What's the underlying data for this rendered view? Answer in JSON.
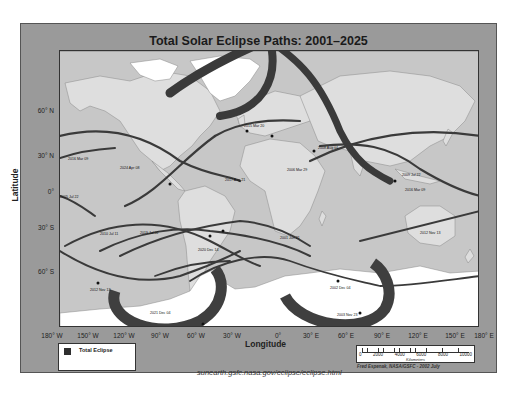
{
  "title": "Total Solar Eclipse Paths: 2001–2025",
  "axes": {
    "latitude_title": "Latitude",
    "longitude_title": "Longitude",
    "latitude_ticks": [
      {
        "label": "60° N",
        "y": 110
      },
      {
        "label": "30° N",
        "y": 155
      },
      {
        "label": "0°",
        "y": 191
      },
      {
        "label": "30° S",
        "y": 227
      },
      {
        "label": "60° S",
        "y": 270
      }
    ],
    "longitude_ticks": [
      {
        "label": "180° W",
        "x": 52
      },
      {
        "label": "150° W",
        "x": 88
      },
      {
        "label": "120° W",
        "x": 124
      },
      {
        "label": "90° W",
        "x": 160
      },
      {
        "label": "60° W",
        "x": 196
      },
      {
        "label": "30° W",
        "x": 232
      },
      {
        "label": "0°",
        "x": 268
      },
      {
        "label": "30° E",
        "x": 304
      },
      {
        "label": "60° E",
        "x": 340
      },
      {
        "label": "90° E",
        "x": 376
      },
      {
        "label": "120° E",
        "x": 412
      },
      {
        "label": "150° E",
        "x": 448
      },
      {
        "label": "180° E",
        "x": 482
      }
    ]
  },
  "eclipse_paths": [
    {
      "label": "2001 Jun 21"
    },
    {
      "label": "2002 Dec 04"
    },
    {
      "label": "2003 Nov 23"
    },
    {
      "label": "2005 Apr 08"
    },
    {
      "label": "2006 Mar 29"
    },
    {
      "label": "2008 Aug 01"
    },
    {
      "label": "2009 Jul 22"
    },
    {
      "label": "2010 Jul 11"
    },
    {
      "label": "2012 Nov 13"
    },
    {
      "label": "2015 Mar 20"
    },
    {
      "label": "2016 Mar 09"
    },
    {
      "label": "2017 Aug 21"
    },
    {
      "label": "2019 Jul 02"
    },
    {
      "label": "2020 Dec 14"
    },
    {
      "label": "2021 Dec 04"
    },
    {
      "label": "2024 Apr 08"
    }
  ],
  "legend": {
    "label": "Total Eclipse",
    "swatch_color": "#2e2e2e"
  },
  "scale_bar": {
    "ticks": [
      "0",
      "2000",
      "4000",
      "6000",
      "8000",
      "10000"
    ],
    "unit": "Kilometers"
  },
  "credit": "Fred Espenak, NASA/GSFC - 2002 July",
  "url": "sunearth.gsfc.nasa.gov/eclipse/eclipse.html",
  "colors": {
    "ocean": "#c7c7c7",
    "land": "#dedede",
    "ice": "#ffffff",
    "path": "#3a3a3a",
    "frame": "#9a9a9a"
  }
}
